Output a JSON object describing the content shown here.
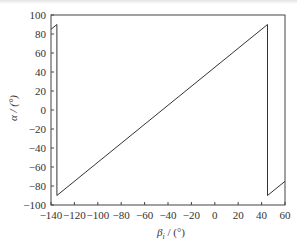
{
  "chart_data": {
    "type": "line",
    "title": "",
    "xlabel": "β_i / (°)",
    "ylabel": "α / (°)",
    "xlim": [
      -140,
      60
    ],
    "ylim": [
      -100,
      100
    ],
    "xticks": [
      -140,
      -120,
      -100,
      -80,
      -60,
      -40,
      -20,
      0,
      20,
      40,
      60
    ],
    "yticks": [
      -100,
      -80,
      -60,
      -40,
      -20,
      0,
      20,
      40,
      60,
      80,
      100
    ],
    "grid": false,
    "legend": null,
    "series": [
      {
        "name": "alpha",
        "color": "#333333",
        "points": [
          [
            -140,
            85
          ],
          [
            -135,
            90
          ],
          [
            -135,
            -90
          ],
          [
            45,
            90
          ],
          [
            45,
            -90
          ],
          [
            60,
            -75
          ]
        ]
      }
    ]
  },
  "labels": {
    "xlabel_main": "β",
    "xlabel_sub": "i",
    "xlabel_unit": " / (°)",
    "ylabel": "α / (°)"
  }
}
